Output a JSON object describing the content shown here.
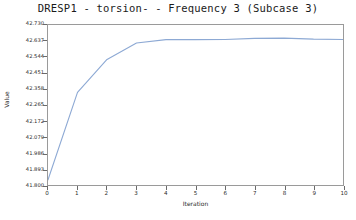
{
  "chart_data": {
    "type": "line",
    "title": "DRESP1 - torsion- - Frequency 3 (Subcase 3)",
    "xlabel": "Iteration",
    "ylabel": "Value",
    "xlim": [
      0,
      10
    ],
    "ylim": [
      41.8,
      42.73
    ],
    "grid": false,
    "legend": null,
    "line_color": "#8da9d4",
    "x": [
      0,
      1,
      2,
      3,
      4,
      5,
      6,
      7,
      8,
      9,
      10
    ],
    "values": [
      41.83,
      42.338,
      42.53,
      42.625,
      42.645,
      42.645,
      42.646,
      42.652,
      42.654,
      42.648,
      42.646
    ],
    "series": [
      {
        "name": "torsion",
        "values": [
          41.83,
          42.338,
          42.53,
          42.625,
          42.645,
          42.645,
          42.646,
          42.652,
          42.654,
          42.648,
          42.646
        ]
      }
    ],
    "xticks": [
      0,
      1,
      2,
      3,
      4,
      5,
      6,
      7,
      8,
      9,
      10
    ],
    "xticklabels": [
      "0",
      "1",
      "2",
      "3",
      "4",
      "5",
      "6",
      "7",
      "8",
      "9",
      "10"
    ],
    "yticks": [
      41.8,
      41.893,
      41.986,
      42.079,
      42.172,
      42.265,
      42.358,
      42.451,
      42.544,
      42.637,
      42.73
    ],
    "yticklabels": [
      "41.800",
      "41.893",
      "41.986",
      "42.079",
      "42.172",
      "42.265",
      "42.358",
      "42.451",
      "42.544",
      "42.637",
      "42.730"
    ]
  }
}
